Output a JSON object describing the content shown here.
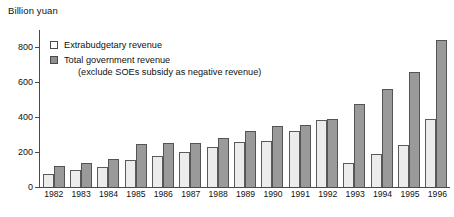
{
  "chart_data": {
    "type": "bar",
    "title": "",
    "ylabel": "Billion yuan",
    "xlabel": "",
    "ylim": [
      0,
      900
    ],
    "yticks": [
      0,
      200,
      400,
      600,
      800
    ],
    "grid": false,
    "legend_position": "upper-left-inside",
    "categories": [
      "1982",
      "1983",
      "1984",
      "1985",
      "1986",
      "1987",
      "1988",
      "1989",
      "1990",
      "1991",
      "1992",
      "1993",
      "1994",
      "1995",
      "1996"
    ],
    "series": [
      {
        "name": "Extrabudgetary revenue",
        "color": "#ececec",
        "values": [
          75,
          95,
          115,
          155,
          175,
          200,
          230,
          260,
          265,
          320,
          385,
          140,
          190,
          240,
          390
        ]
      },
      {
        "name": "Total government revenue (exclude SOEs subsidy as negative revenue)",
        "color": "#9a9a9a",
        "values": [
          118,
          135,
          160,
          245,
          250,
          255,
          280,
          320,
          350,
          355,
          390,
          475,
          560,
          660,
          840
        ]
      }
    ],
    "legend_entries": [
      {
        "label": "Extrabudgetary revenue",
        "sub": "",
        "swatch": "light"
      },
      {
        "label": "Total government revenue",
        "sub": "(exclude SOEs subsidy as negative revenue)",
        "swatch": "dark"
      }
    ]
  }
}
